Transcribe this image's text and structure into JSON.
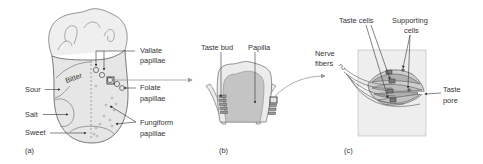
{
  "colors": {
    "background": "#ffffff",
    "outline": "#666666",
    "tissue_light": "#ececec",
    "tissue_mid": "#d3d3d3",
    "tissue_dark": "#b8b8b8",
    "text": "#333333",
    "connector": "#9a9a9a"
  },
  "panel_a": {
    "label": "(a)",
    "regions": {
      "bitter": "Bitter",
      "sour": "Sour",
      "salt": "Salt",
      "sweet": "Sweet"
    },
    "papillae_labels": {
      "vallate_1": "Vallate",
      "vallate_2": "papillae",
      "folate_1": "Folate",
      "folate_2": "papillae",
      "fungiform_1": "Fungiform",
      "fungiform_2": "papillae"
    }
  },
  "panel_b": {
    "label": "(b)",
    "taste_bud": "Taste bud",
    "papilla": "Papilla"
  },
  "panel_c": {
    "label": "(c)",
    "taste_cells": "Taste cells",
    "supporting_1": "Supporting",
    "supporting_2": "cells",
    "nerve_1": "Nerve",
    "nerve_2": "fibers",
    "pore_1": "Taste",
    "pore_2": "pore"
  }
}
